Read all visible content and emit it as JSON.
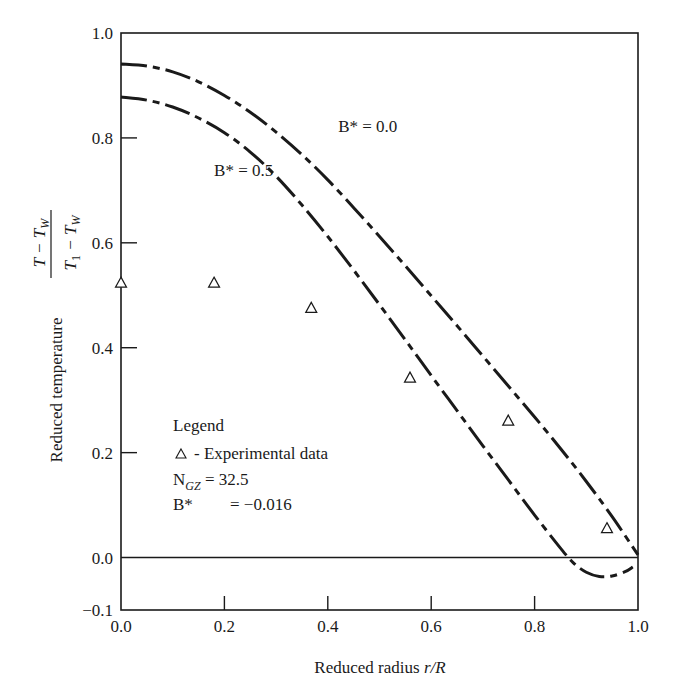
{
  "chart_data": {
    "type": "line",
    "title": "",
    "xlabel": "Reduced radius r/R",
    "xlabel_plain": "Reduced radius ",
    "xlabel_italic": "r/R",
    "ylabel": "Reduced temperature (T − T_W)/(T_1 − T_W)",
    "ylabel_plain": "Reduced temperature",
    "ylabel_numerator": "T − T",
    "ylabel_numerator_sub": "W",
    "ylabel_denominator_a": "T",
    "ylabel_denominator_a_sub": "1",
    "ylabel_denominator_b": " − T",
    "ylabel_denominator_b_sub": "W",
    "xlim": [
      0.0,
      1.0
    ],
    "ylim": [
      -0.1,
      1.0
    ],
    "xticks": [
      0.0,
      0.2,
      0.4,
      0.6,
      0.8,
      1.0
    ],
    "xtick_labels": [
      "0.0",
      "0.2",
      "0.4",
      "0.6",
      "0.8",
      "1.0"
    ],
    "yticks": [
      -0.1,
      0.0,
      0.2,
      0.4,
      0.6,
      0.8,
      1.0
    ],
    "ytick_labels": [
      "−0.1",
      "0.0",
      "0.2",
      "0.4",
      "0.6",
      "0.8",
      "1.0"
    ],
    "grid": false,
    "zero_line": true,
    "series": [
      {
        "name": "B* = 0.0",
        "style": "dash-dot",
        "x": [
          0.0,
          0.05,
          0.1,
          0.15,
          0.2,
          0.25,
          0.3,
          0.35,
          0.4,
          0.45,
          0.5,
          0.55,
          0.6,
          0.65,
          0.7,
          0.75,
          0.8,
          0.85,
          0.9,
          0.95,
          1.0
        ],
        "y": [
          0.941,
          0.937,
          0.926,
          0.907,
          0.881,
          0.849,
          0.811,
          0.768,
          0.72,
          0.667,
          0.612,
          0.556,
          0.499,
          0.442,
          0.384,
          0.326,
          0.268,
          0.208,
          0.145,
          0.078,
          0.005
        ]
      },
      {
        "name": "B* = 0.5",
        "style": "dash-dot",
        "x": [
          0.0,
          0.05,
          0.1,
          0.15,
          0.2,
          0.25,
          0.3,
          0.35,
          0.4,
          0.45,
          0.5,
          0.55,
          0.6,
          0.65,
          0.7,
          0.75,
          0.8,
          0.85,
          0.875,
          0.9,
          0.925,
          0.95,
          0.975,
          0.99
        ],
        "y": [
          0.878,
          0.872,
          0.859,
          0.838,
          0.81,
          0.773,
          0.727,
          0.672,
          0.612,
          0.548,
          0.482,
          0.415,
          0.347,
          0.28,
          0.213,
          0.147,
          0.081,
          0.018,
          -0.01,
          -0.028,
          -0.036,
          -0.035,
          -0.027,
          -0.018
        ]
      },
      {
        "name": "Experimental data",
        "style": "triangle-markers",
        "x": [
          0.0,
          0.18,
          0.368,
          0.559,
          0.749,
          0.94
        ],
        "y": [
          0.525,
          0.525,
          0.477,
          0.344,
          0.262,
          0.057
        ]
      }
    ],
    "annotations": [
      {
        "text": "B* = 0.0",
        "near_x": 0.42,
        "near_y": 0.8
      },
      {
        "text": "B* = 0.5",
        "near_x": 0.18,
        "near_y": 0.72
      }
    ],
    "legend": {
      "position": "lower-left",
      "title": "Legend",
      "marker_symbol": "△",
      "entry_label": " - Experimental data",
      "ngz_label": "N",
      "ngz_sub": "GZ",
      "ngz_value": " = 32.5",
      "bstar_label": "B*",
      "bstar_value": "= −0.016"
    }
  }
}
